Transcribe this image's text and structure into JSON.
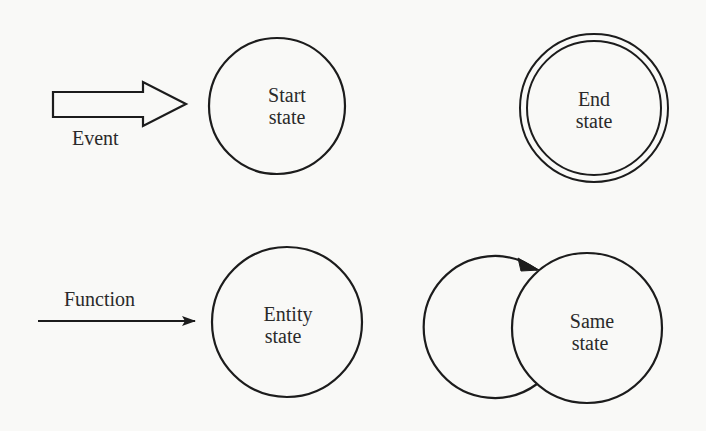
{
  "diagram": {
    "type": "state-diagram-legend",
    "colors": {
      "background": "#f9f9f7",
      "stroke": "#1c1c1c",
      "text": "#2a2a2a"
    },
    "elements": [
      {
        "id": "event",
        "shape": "block-arrow",
        "label": "Event"
      },
      {
        "id": "start_state",
        "shape": "circle",
        "label_line1": "Start",
        "label_line2": "state"
      },
      {
        "id": "end_state",
        "shape": "double-circle",
        "label_line1": "End",
        "label_line2": "state"
      },
      {
        "id": "function",
        "shape": "line-arrow",
        "label": "Function"
      },
      {
        "id": "entity_state",
        "shape": "circle",
        "label_line1": "Entity",
        "label_line2": "state"
      },
      {
        "id": "same_state",
        "shape": "circle-with-self-loop",
        "label_line1": "Same",
        "label_line2": "state"
      }
    ]
  },
  "labels": {
    "event": "Event",
    "start_1": "Start",
    "start_2": "state",
    "end_1": "End",
    "end_2": "state",
    "function": "Function",
    "entity_1": "Entity",
    "entity_2": "state",
    "same_1": "Same",
    "same_2": "state"
  }
}
